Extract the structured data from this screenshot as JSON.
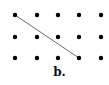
{
  "diagram": {
    "caption": "b.",
    "grid": {
      "columns": 5,
      "rows": 3,
      "x_positions": [
        15,
        37,
        58,
        79,
        101
      ],
      "y_positions": [
        15,
        37,
        58
      ],
      "dot_radius": 2.2,
      "dot_color": "#000000"
    },
    "segment": {
      "from": {
        "col": 0,
        "row": 0
      },
      "to": {
        "col": 3,
        "row": 2
      },
      "color": "#444444"
    }
  }
}
